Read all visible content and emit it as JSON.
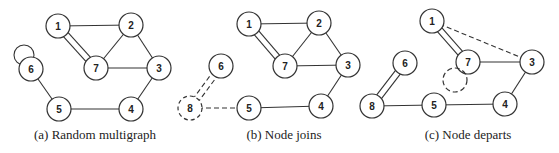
{
  "figure": {
    "panels": [
      {
        "id": "a",
        "caption": "(a) Random multigraph",
        "caption_pos": [
          95,
          139
        ],
        "nodes": [
          {
            "label": "1",
            "x": 58,
            "y": 26,
            "style": "solid"
          },
          {
            "label": "2",
            "x": 131,
            "y": 25,
            "style": "solid"
          },
          {
            "label": "6",
            "x": 31,
            "y": 69,
            "style": "solid"
          },
          {
            "label": "7",
            "x": 96,
            "y": 68,
            "style": "solid"
          },
          {
            "label": "3",
            "x": 159,
            "y": 68,
            "style": "solid"
          },
          {
            "label": "5",
            "x": 59,
            "y": 109,
            "style": "solid"
          },
          {
            "label": "4",
            "x": 131,
            "y": 109,
            "style": "solid"
          }
        ],
        "edges": [
          {
            "from": "1",
            "to": "2",
            "style": "solid"
          },
          {
            "from": "1",
            "to": "7",
            "style": "solid",
            "multiplicity": 2
          },
          {
            "from": "2",
            "to": "7",
            "style": "solid"
          },
          {
            "from": "2",
            "to": "3",
            "style": "solid"
          },
          {
            "from": "7",
            "to": "3",
            "style": "solid"
          },
          {
            "from": "3",
            "to": "4",
            "style": "solid"
          },
          {
            "from": "4",
            "to": "5",
            "style": "solid"
          },
          {
            "from": "5",
            "to": "6",
            "style": "solid"
          },
          {
            "from": "6",
            "to": "6",
            "style": "self-loop"
          }
        ]
      },
      {
        "id": "b",
        "caption": "(b) Node joins",
        "caption_pos": [
          284,
          139
        ],
        "nodes": [
          {
            "label": "1",
            "x": 249,
            "y": 24,
            "style": "solid"
          },
          {
            "label": "2",
            "x": 319,
            "y": 23,
            "style": "solid"
          },
          {
            "label": "6",
            "x": 221,
            "y": 66,
            "style": "solid"
          },
          {
            "label": "7",
            "x": 285,
            "y": 66,
            "style": "solid"
          },
          {
            "label": "3",
            "x": 348,
            "y": 65,
            "style": "solid"
          },
          {
            "label": "8",
            "x": 190,
            "y": 108,
            "style": "dashed"
          },
          {
            "label": "5",
            "x": 249,
            "y": 108,
            "style": "solid"
          },
          {
            "label": "4",
            "x": 321,
            "y": 106,
            "style": "solid"
          }
        ],
        "edges": [
          {
            "from": "1",
            "to": "2",
            "style": "solid"
          },
          {
            "from": "1",
            "to": "7",
            "style": "solid",
            "multiplicity": 2
          },
          {
            "from": "2",
            "to": "7",
            "style": "solid"
          },
          {
            "from": "2",
            "to": "3",
            "style": "solid"
          },
          {
            "from": "7",
            "to": "3",
            "style": "solid"
          },
          {
            "from": "3",
            "to": "4",
            "style": "solid"
          },
          {
            "from": "4",
            "to": "5",
            "style": "solid"
          },
          {
            "from": "8",
            "to": "6",
            "style": "dashed",
            "multiplicity": 2
          },
          {
            "from": "8",
            "to": "5",
            "style": "dashed"
          }
        ]
      },
      {
        "id": "c",
        "caption": "(c) Node departs",
        "caption_pos": [
          468,
          139
        ],
        "nodes": [
          {
            "label": "1",
            "x": 432,
            "y": 21,
            "style": "solid"
          },
          {
            "label": "6",
            "x": 405,
            "y": 63,
            "style": "solid"
          },
          {
            "label": "7",
            "x": 468,
            "y": 62,
            "style": "solid"
          },
          {
            "label": "3",
            "x": 532,
            "y": 62,
            "style": "solid"
          },
          {
            "label": "",
            "x": 455,
            "y": 80,
            "style": "dashed"
          },
          {
            "label": "8",
            "x": 372,
            "y": 106,
            "style": "solid"
          },
          {
            "label": "5",
            "x": 434,
            "y": 105,
            "style": "solid"
          },
          {
            "label": "4",
            "x": 505,
            "y": 104,
            "style": "solid"
          }
        ],
        "edges": [
          {
            "from": "1",
            "to": "7",
            "style": "solid",
            "multiplicity": 2
          },
          {
            "from": "1",
            "to": "3",
            "style": "dashed"
          },
          {
            "from": "7",
            "to": "3",
            "style": "solid"
          },
          {
            "from": "3",
            "to": "4",
            "style": "solid"
          },
          {
            "from": "4",
            "to": "5",
            "style": "solid"
          },
          {
            "from": "5",
            "to": "8",
            "style": "solid"
          },
          {
            "from": "8",
            "to": "6",
            "style": "solid",
            "multiplicity": 2
          }
        ]
      }
    ],
    "node_radius": 12
  }
}
